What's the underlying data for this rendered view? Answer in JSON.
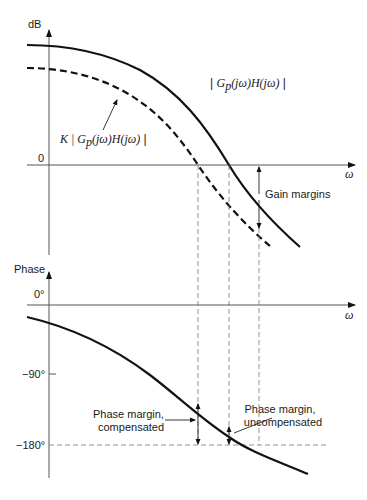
{
  "magnitude_plot": {
    "y_axis_label": "dB",
    "x_axis_label": "ω",
    "zero_label": "0",
    "curve_uncompensated_label": {
      "prefix": "| ",
      "G": "G",
      "sub": "p",
      "rest": "(jω)H(jω)",
      "suffix": " |"
    },
    "curve_compensated_label": {
      "prefix": "K | ",
      "G": "G",
      "sub": "p",
      "rest": "(jω)H(jω)",
      "suffix": " |"
    },
    "gain_margin_label": "Gain margins"
  },
  "phase_plot": {
    "y_axis_label": "Phase",
    "x_axis_label": "ω",
    "ticks": [
      "0°",
      "−90°",
      "−180°"
    ],
    "phase_margin_compensated_label": [
      "Phase margin,",
      "compensated"
    ],
    "phase_margin_uncompensated_label": [
      "Phase margin,",
      "uncompensated"
    ]
  }
}
